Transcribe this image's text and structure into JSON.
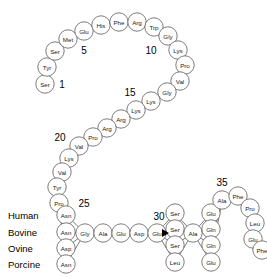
{
  "diagram": {
    "type": "peptide-sequence-chain",
    "circle_radius": 9.2,
    "colors": {
      "circle_fill": "#ffffff",
      "circle_stroke": "#5a5a5a",
      "text": "#1a1a1a",
      "number": "#000000",
      "marker": "#000000"
    },
    "residues": [
      {
        "label": "Ser",
        "x": 45,
        "y": 84,
        "pos": 1
      },
      {
        "label": "Tyr",
        "x": 47,
        "y": 67,
        "pos": 2
      },
      {
        "label": "Ser",
        "x": 55,
        "y": 51,
        "pos": 3
      },
      {
        "label": "Met",
        "x": 68,
        "y": 39,
        "pos": 4
      },
      {
        "label": "Glu",
        "x": 84,
        "y": 31,
        "pos": 5
      },
      {
        "label": "His",
        "x": 101,
        "y": 25,
        "pos": 6
      },
      {
        "label": "Phe",
        "x": 119,
        "y": 22,
        "pos": 7
      },
      {
        "label": "Arg",
        "x": 137,
        "y": 22,
        "pos": 8
      },
      {
        "label": "Trp",
        "x": 154,
        "y": 27,
        "pos": 9
      },
      {
        "label": "Gly",
        "x": 168,
        "y": 36,
        "pos": 10
      },
      {
        "label": "Lys",
        "x": 178,
        "y": 50,
        "pos": 11
      },
      {
        "label": "Pro",
        "x": 185,
        "y": 65,
        "pos": 12
      },
      {
        "label": "Val",
        "x": 180,
        "y": 81,
        "pos": 13
      },
      {
        "label": "Gly",
        "x": 167,
        "y": 92,
        "pos": 14
      },
      {
        "label": "Lys",
        "x": 151,
        "y": 101,
        "pos": 15
      },
      {
        "label": "Lys",
        "x": 136,
        "y": 110,
        "pos": 16
      },
      {
        "label": "Arg",
        "x": 121,
        "y": 119,
        "pos": 17
      },
      {
        "label": "Arg",
        "x": 107,
        "y": 128,
        "pos": 18
      },
      {
        "label": "Pro",
        "x": 93,
        "y": 137,
        "pos": 19
      },
      {
        "label": "Val",
        "x": 79,
        "y": 146,
        "pos": 20
      },
      {
        "label": "Lys",
        "x": 69,
        "y": 158,
        "pos": 21
      },
      {
        "label": "Val",
        "x": 62,
        "y": 172,
        "pos": 22
      },
      {
        "label": "Tyr",
        "x": 57,
        "y": 187,
        "pos": 23
      },
      {
        "label": "Pro",
        "x": 59,
        "y": 203,
        "pos": 24
      }
    ],
    "variant_column": {
      "number": "25",
      "number_x": 84,
      "number_y": 203,
      "species": [
        {
          "name": "Human",
          "residue": "Asn",
          "label_x": 8,
          "label_y": 215,
          "cx": 66,
          "cy": 215
        },
        {
          "name": "Bovine",
          "residue": "Asn",
          "label_x": 8,
          "label_y": 232,
          "cx": 66,
          "cy": 232
        },
        {
          "name": "Ovine",
          "residue": "Asp",
          "label_x": 8,
          "label_y": 248,
          "cx": 66,
          "cy": 248
        },
        {
          "name": "Porcine",
          "residue": "Asn",
          "label_x": 8,
          "label_y": 264,
          "cx": 66,
          "cy": 264
        }
      ]
    },
    "mid_chain": [
      {
        "label": "Gly",
        "x": 85,
        "y": 233,
        "pos": 26
      },
      {
        "label": "Ala",
        "x": 103,
        "y": 233,
        "pos": 27
      },
      {
        "label": "Glu",
        "x": 121,
        "y": 233,
        "pos": 28
      },
      {
        "label": "Asp",
        "x": 139,
        "y": 233,
        "pos": 29
      },
      {
        "label": "Glu",
        "x": 157,
        "y": 233,
        "pos": 30
      }
    ],
    "number_30": {
      "text": "30",
      "x": 159,
      "y": 216
    },
    "marker_arrow": {
      "x": 167,
      "y": 233
    },
    "variant_column_2": {
      "cx": 175,
      "residues": [
        {
          "label": "Ser",
          "cy": 213
        },
        {
          "label": "Ser",
          "cy": 229
        },
        {
          "label": "Ser",
          "cy": 245
        },
        {
          "label": "Leu",
          "cy": 262
        }
      ]
    },
    "center_ala": {
      "label": "Ala",
      "x": 193,
      "y": 233
    },
    "variant_column_3": {
      "cx": 211,
      "residues": [
        {
          "label": "Glu",
          "cy": 213
        },
        {
          "label": "Gln",
          "cy": 229
        },
        {
          "label": "Gln",
          "cy": 245
        },
        {
          "label": "Glu",
          "cy": 262
        }
      ]
    },
    "tail_chain": [
      {
        "label": "Ala",
        "x": 222,
        "y": 200,
        "pos": 35
      },
      {
        "label": "Phe",
        "x": 238,
        "y": 196,
        "pos": 36
      },
      {
        "label": "Pro",
        "x": 250,
        "y": 208,
        "pos": 37
      },
      {
        "label": "Leu",
        "x": 255,
        "y": 223,
        "pos": 38
      },
      {
        "label": "Glu",
        "x": 253,
        "y": 239,
        "pos": 39
      },
      {
        "label": "Phe",
        "x": 262,
        "y": 250,
        "pos": 40
      }
    ],
    "numbers": [
      {
        "text": "1",
        "x": 62,
        "y": 84
      },
      {
        "text": "5",
        "x": 84,
        "y": 50
      },
      {
        "text": "10",
        "x": 151,
        "y": 50
      },
      {
        "text": "15",
        "x": 130,
        "y": 92
      },
      {
        "text": "20",
        "x": 60,
        "y": 137
      },
      {
        "text": "35",
        "x": 222,
        "y": 182
      }
    ]
  }
}
